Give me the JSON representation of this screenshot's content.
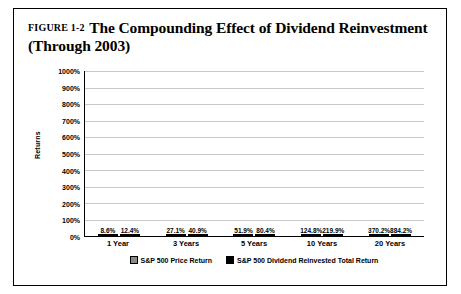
{
  "figure": {
    "label": "FIGURE 1-2",
    "title": "The Compounding Effect of Dividend Reinvestment (Through 2003)"
  },
  "chart_data": {
    "type": "bar",
    "title": "The Compounding Effect of Dividend Reinvestment (Through 2003)",
    "xlabel": "",
    "ylabel": "Returns",
    "ylim": [
      0,
      1000
    ],
    "ytick_labels": [
      "1000%",
      "900%",
      "800%",
      "700%",
      "600%",
      "500%",
      "400%",
      "300%",
      "200%",
      "100%",
      "0%"
    ],
    "ytick_values": [
      1000,
      900,
      800,
      700,
      600,
      500,
      400,
      300,
      200,
      100,
      0
    ],
    "grid": true,
    "legend_position": "bottom",
    "categories": [
      "1 Year",
      "3 Years",
      "5 Years",
      "10 Years",
      "20 Years"
    ],
    "series": [
      {
        "name": "S&P 500 Price Return",
        "color": "#8a8a8a",
        "values": [
          8.6,
          27.1,
          51.9,
          124.8,
          370.2
        ],
        "labels": [
          "8.6%",
          "27.1%",
          "51.9%",
          "124.8%",
          "370.2%"
        ]
      },
      {
        "name": "S&P 500 Dividend Reinvested Total Return",
        "color": "#000000",
        "values": [
          12.4,
          40.9,
          80.4,
          219.9,
          884.2
        ],
        "labels": [
          "12.4%",
          "40.9%",
          "80.4%",
          "219.9%",
          "884.2%"
        ]
      }
    ]
  }
}
